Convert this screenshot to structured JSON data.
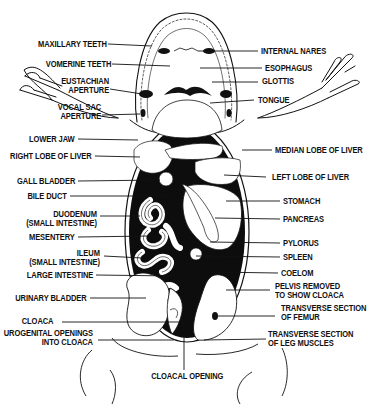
{
  "diagram": {
    "colors": {
      "ink": "#111111",
      "background": "#ffffff",
      "cavity": "#0d0d0d"
    },
    "labels_left": [
      {
        "id": "maxillary-teeth",
        "lines": [
          "MAXILLARY TEETH"
        ]
      },
      {
        "id": "vomerine-teeth",
        "lines": [
          "VOMERINE TEETH"
        ]
      },
      {
        "id": "eustachian-aperture",
        "lines": [
          "EUSTACHIAN",
          "APERTURE"
        ]
      },
      {
        "id": "vocal-sac-aperture",
        "lines": [
          "VOCAL SAC",
          "APERTURE"
        ]
      },
      {
        "id": "lower-jaw",
        "lines": [
          "LOWER JAW"
        ]
      },
      {
        "id": "right-lobe-of-liver",
        "lines": [
          "RIGHT LOBE OF LIVER"
        ]
      },
      {
        "id": "gall-bladder",
        "lines": [
          "GALL BLADDER"
        ]
      },
      {
        "id": "bile-duct",
        "lines": [
          "BILE DUCT"
        ]
      },
      {
        "id": "duodenum",
        "lines": [
          "DUODENUM",
          "(SMALL INTESTINE)"
        ]
      },
      {
        "id": "mesentery",
        "lines": [
          "MESENTERY"
        ]
      },
      {
        "id": "ileum",
        "lines": [
          "ILEUM",
          "(SMALL INTESTINE)"
        ]
      },
      {
        "id": "large-intestine",
        "lines": [
          "LARGE INTESTINE"
        ]
      },
      {
        "id": "urinary-bladder",
        "lines": [
          "URINARY BLADDER"
        ]
      },
      {
        "id": "cloaca",
        "lines": [
          "CLOACA"
        ]
      },
      {
        "id": "urogenital-openings",
        "lines": [
          "UROGENITAL OPENINGS",
          "INTO CLOACA"
        ]
      }
    ],
    "labels_right": [
      {
        "id": "internal-nares",
        "lines": [
          "INTERNAL NARES"
        ]
      },
      {
        "id": "esophagus",
        "lines": [
          "ESOPHAGUS"
        ]
      },
      {
        "id": "glottis",
        "lines": [
          "GLOTTIS"
        ]
      },
      {
        "id": "tongue",
        "lines": [
          "TONGUE"
        ]
      },
      {
        "id": "median-lobe-of-liver",
        "lines": [
          "MEDIAN LOBE OF LIVER"
        ]
      },
      {
        "id": "left-lobe-of-liver",
        "lines": [
          "LEFT LOBE OF LIVER"
        ]
      },
      {
        "id": "stomach",
        "lines": [
          "STOMACH"
        ]
      },
      {
        "id": "pancreas",
        "lines": [
          "PANCREAS"
        ]
      },
      {
        "id": "pylorus",
        "lines": [
          "PYLORUS"
        ]
      },
      {
        "id": "spleen",
        "lines": [
          "SPLEEN"
        ]
      },
      {
        "id": "coelom",
        "lines": [
          "COELOM"
        ]
      },
      {
        "id": "pelvis-removed",
        "lines": [
          "PELVIS REMOVED",
          "TO SHOW CLOACA"
        ]
      },
      {
        "id": "transverse-section-femur",
        "lines": [
          "TRANSVERSE SECTION",
          "OF FEMUR"
        ]
      },
      {
        "id": "transverse-section-leg-muscles",
        "lines": [
          "TRANSVERSE SECTION",
          "OF LEG MUSCLES"
        ]
      }
    ],
    "labels_bottom": [
      {
        "id": "cloacal-opening",
        "lines": [
          "CLOACAL OPENING"
        ]
      }
    ]
  }
}
